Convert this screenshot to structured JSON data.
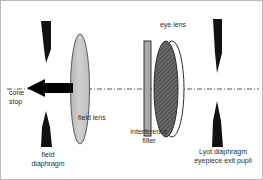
{
  "figure": {
    "kind": "optical-ray-diagram",
    "title_visible": false,
    "background_color": "#ffffff",
    "border_color": "#b9b9b9",
    "axis": {
      "name": "optical-axis",
      "style": "dash-dot",
      "color": "#555555",
      "y": 88,
      "x_start": 6,
      "x_end": 258
    }
  },
  "labels": {
    "cone_stop": "cone\nstop",
    "field_lens": "field lens",
    "field_diaphragm": "field\ndiaphragm",
    "eye_lens": "eye lens",
    "interference_filter": "interference\nfilter",
    "lyot_diaphragm": "Lyot diaphragm\neyepiece exit pupil"
  },
  "components": [
    {
      "id": "field-diaphragm-upper-blade",
      "label_ref": "field_diaphragm",
      "shape": "tapered-blade",
      "orientation": "points-down",
      "color": "#111111",
      "x": 40,
      "y": 20,
      "width": 10,
      "height": 42
    },
    {
      "id": "field-diaphragm-lower-blade",
      "label_ref": "field_diaphragm",
      "shape": "tapered-blade",
      "orientation": "points-up",
      "color": "#111111",
      "x": 40,
      "y": 110,
      "width": 10,
      "height": 36
    },
    {
      "id": "cone-stop-arrow",
      "label_ref": "cone_stop",
      "shape": "arrow",
      "direction": "left",
      "color": "#000000",
      "x": 26,
      "y": 78,
      "width": 46,
      "height": 18
    },
    {
      "id": "field-lens",
      "label_ref": "field_lens",
      "shape": "biconvex-lens",
      "fill": "#c4c4c4",
      "stroke": "#4a4a4a",
      "cx": 79,
      "cy": 88,
      "rx": 9,
      "ry": 55
    },
    {
      "id": "interference-filter",
      "label_ref": "interference_filter",
      "shape": "thin-plate",
      "fill": "#a8a8a8",
      "stroke": "#3a3a3a",
      "x": 143,
      "y": 40,
      "width": 7,
      "height": 95
    },
    {
      "id": "eye-lens",
      "label_ref": "eye_lens",
      "shape": "biconvex-lens-hatched",
      "fill": "#5a5a5a",
      "stroke": "#2e2e2e",
      "cx": 166,
      "cy": 88,
      "rx": 12,
      "ry": 48
    },
    {
      "id": "eye-lens-outline-crescent",
      "shape": "lens-outline",
      "stroke": "#2e2e2e",
      "cx": 172,
      "cy": 88,
      "rx": 12,
      "ry": 48
    },
    {
      "id": "lyot-diaphragm-upper-blade",
      "label_ref": "lyot_diaphragm",
      "shape": "tapered-blade",
      "orientation": "points-down",
      "color": "#111111",
      "x": 211,
      "y": 18,
      "width": 10,
      "height": 54
    },
    {
      "id": "lyot-diaphragm-lower-blade",
      "label_ref": "lyot_diaphragm",
      "shape": "tapered-blade",
      "orientation": "points-up",
      "color": "#111111",
      "x": 211,
      "y": 100,
      "width": 10,
      "height": 46
    }
  ],
  "label_positions": {
    "cone_stop": {
      "x": 8,
      "y": 92,
      "align": "left"
    },
    "field_lens": {
      "x": 76,
      "y": 114,
      "align": "left"
    },
    "field_diaphragm": {
      "x": 23,
      "y": 152,
      "align": "center",
      "width": 54
    },
    "eye_lens": {
      "x": 152,
      "y": 21,
      "align": "center",
      "width": 40
    },
    "interference_filter": {
      "x": 123,
      "y": 128,
      "align": "center",
      "width": 56
    },
    "lyot_diaphragm": {
      "x": 185,
      "y": 148,
      "align": "center",
      "width": 76
    }
  }
}
